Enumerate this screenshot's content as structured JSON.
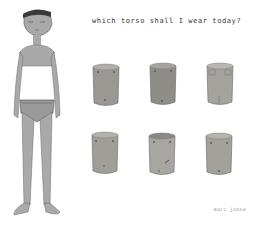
{
  "artwork": {
    "title": "which torso shall I wear today?",
    "signature": "marc johns",
    "colors": {
      "background": "#ffffff",
      "skin": "#a9a9a9",
      "torso_fill": "#9a9893",
      "outline": "#555555"
    }
  },
  "torsos": [
    {
      "row": 1,
      "col": 1,
      "x": 91,
      "y": 62
    },
    {
      "row": 1,
      "col": 2,
      "x": 148,
      "y": 61
    },
    {
      "row": 1,
      "col": 3,
      "x": 205,
      "y": 61
    },
    {
      "row": 2,
      "col": 1,
      "x": 90,
      "y": 130
    },
    {
      "row": 2,
      "col": 2,
      "x": 147,
      "y": 131
    },
    {
      "row": 2,
      "col": 3,
      "x": 204,
      "y": 131
    }
  ]
}
